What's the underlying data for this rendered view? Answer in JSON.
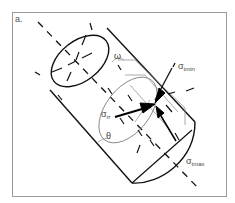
{
  "figure": {
    "panel_label": "a.",
    "labels": {
      "omega": "ω",
      "theta": "θ",
      "sigma_rr_base": "σ",
      "sigma_rr_sub": "rr",
      "sigma_tmin_base": "σ",
      "sigma_tmin_sub": "tmin",
      "sigma_tmax_base": "σ",
      "sigma_tmax_sub": "tmax"
    },
    "colors": {
      "frame": "#999999",
      "line": "#111111",
      "thin_line": "#777777",
      "text": "#444444"
    }
  }
}
